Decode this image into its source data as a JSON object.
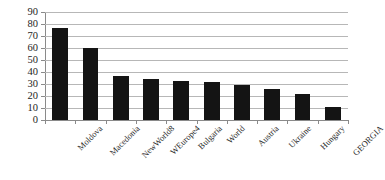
{
  "chart_data": {
    "type": "bar",
    "title": "",
    "subtitle": "",
    "xlabel": "",
    "ylabel": "",
    "categories": [
      "Moldova",
      "Macedonia",
      "NewWorld8",
      "WEurope4",
      "Bulgaria",
      "World",
      "Austria",
      "Ukraine",
      "Hungary",
      "GEORGIA"
    ],
    "values": [
      77,
      60,
      36.5,
      34.5,
      32.5,
      31.5,
      29.5,
      26,
      21.5,
      10.5
    ],
    "ylim": [
      0,
      90
    ],
    "yticks": [
      0,
      10,
      20,
      30,
      40,
      50,
      60,
      70,
      80,
      90
    ],
    "ytick_labels": [
      "0",
      "10",
      "20",
      "30",
      "40",
      "50",
      "60",
      "70",
      "80",
      "90"
    ],
    "grid": true,
    "legend": false,
    "legend_position": "none",
    "bar_color": "#141414",
    "grid_color": "#b7b7b7",
    "axis_color": "#8a8a8a"
  }
}
